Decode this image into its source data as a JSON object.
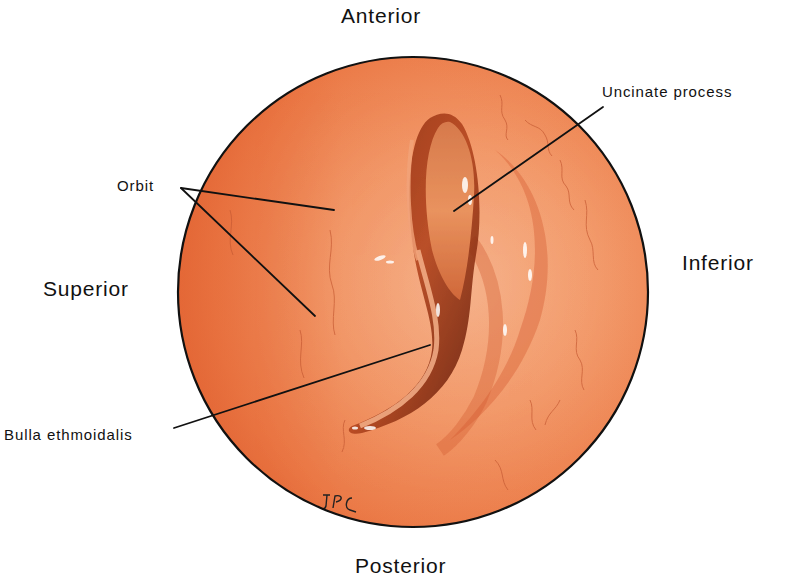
{
  "figure": {
    "orientation_labels": {
      "top": "Anterior",
      "bottom": "Posterior",
      "left": "Superior",
      "right": "Inferior"
    },
    "structure_labels": {
      "orbit": "Orbit",
      "uncinate_process": "Uncinate process",
      "bulla_ethmoidalis": "Bulla ethmoidalis"
    },
    "signature": "JPC",
    "colors": {
      "tissue_base": "#ef8350",
      "tissue_light": "#f6b48c",
      "tissue_dark": "#c8522b",
      "recess_dark": "#6e2210",
      "outline": "#111111",
      "background": "#ffffff"
    }
  }
}
